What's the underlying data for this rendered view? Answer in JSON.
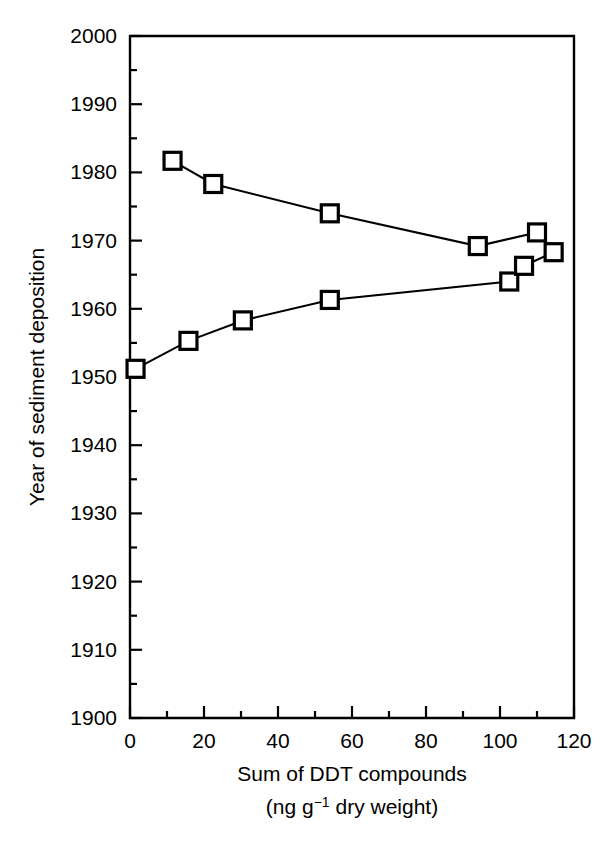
{
  "chart_data": {
    "type": "line",
    "title": "",
    "subtitle": "",
    "xlabel": "Sum of DDT compounds",
    "xlabel_units": "(ng g⁻¹ dry weight)",
    "xlabel_units_pre": "(ng g",
    "xlabel_units_sup": "−1",
    "xlabel_units_post": " dry weight)",
    "ylabel": "Year of sediment deposition",
    "xlim": [
      0,
      120
    ],
    "ylim": [
      1900,
      2000
    ],
    "x_major_ticks": [
      0,
      20,
      40,
      60,
      80,
      100,
      120
    ],
    "x_minor_ticks": [
      10,
      30,
      50,
      70,
      90,
      110
    ],
    "x_tick_labels": [
      "0",
      "20",
      "40",
      "60",
      "80",
      "100",
      "120"
    ],
    "y_major_ticks": [
      1900,
      1910,
      1920,
      1930,
      1940,
      1950,
      1960,
      1970,
      1980,
      1990,
      2000
    ],
    "y_minor_ticks": [
      1905,
      1915,
      1925,
      1935,
      1945,
      1955,
      1965,
      1975,
      1985,
      1995
    ],
    "y_tick_labels": [
      "1900",
      "1910",
      "1920",
      "1930",
      "1940",
      "1950",
      "1960",
      "1970",
      "1980",
      "1990",
      "2000"
    ],
    "grid": false,
    "legend": false,
    "legend_position": "none",
    "marker": "open-square",
    "marker_color": "#ffffff",
    "line_color": "#000000",
    "series": [
      {
        "name": "Sediment core DDT profile",
        "x": [
          1.5,
          15.8,
          30.5,
          54.0,
          102.5,
          106.5,
          114.5,
          110.0,
          94.0,
          54.0,
          22.5,
          11.5
        ],
        "y": [
          1951.2,
          1955.3,
          1958.3,
          1961.3,
          1964.0,
          1966.3,
          1968.3,
          1971.2,
          1969.2,
          1974.0,
          1978.3,
          1981.7
        ]
      }
    ]
  },
  "axes": {
    "frame_color": "#000000",
    "background": "#ffffff"
  }
}
